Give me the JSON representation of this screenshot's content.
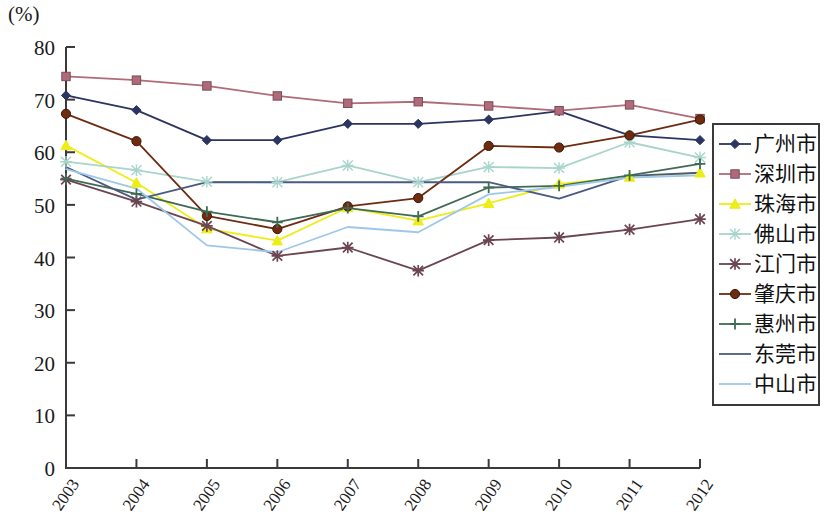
{
  "axis_unit_label": "(%)",
  "chart_data": {
    "type": "line",
    "title": "",
    "subtitle": "",
    "xlabel": "",
    "ylabel": "(%)",
    "ylim": [
      0,
      80
    ],
    "ytick_values": [
      0,
      10,
      20,
      30,
      40,
      50,
      60,
      70,
      80
    ],
    "ytick_labels": [
      "0",
      "10",
      "20",
      "30",
      "40",
      "50",
      "60",
      "70",
      "80"
    ],
    "grid": false,
    "legend_position": "right",
    "categories": [
      "2003",
      "2004",
      "2005",
      "2006",
      "2007",
      "2008",
      "2009",
      "2010",
      "2011",
      "2012"
    ],
    "x": [
      2003,
      2004,
      2005,
      2006,
      2007,
      2008,
      2009,
      2010,
      2011,
      2012
    ],
    "series": [
      {
        "name": "广州市",
        "color": "#2b3560",
        "marker": "diamond",
        "values": [
          70.8,
          68.0,
          62.3,
          62.3,
          65.4,
          65.4,
          66.2,
          67.8,
          63.2,
          62.3
        ]
      },
      {
        "name": "深圳市",
        "color": "#b06b7a",
        "marker": "square",
        "values": [
          74.4,
          73.7,
          72.6,
          70.7,
          69.3,
          69.6,
          68.8,
          67.9,
          69.0,
          66.4
        ]
      },
      {
        "name": "珠海市",
        "color": "#eded18",
        "marker": "triangle",
        "values": [
          61.3,
          54.2,
          45.5,
          43.2,
          49.5,
          47.0,
          50.3,
          54.0,
          55.3,
          56.1
        ]
      },
      {
        "name": "佛山市",
        "color": "#a8d5cb",
        "marker": "star",
        "values": [
          58.2,
          56.6,
          54.4,
          54.3,
          57.5,
          54.3,
          57.2,
          57.0,
          61.9,
          59.0
        ]
      },
      {
        "name": "江门市",
        "color": "#6b4550",
        "marker": "asterisk",
        "values": [
          54.8,
          50.6,
          46.0,
          40.3,
          41.9,
          37.5,
          43.3,
          43.8,
          45.3,
          47.3
        ]
      },
      {
        "name": "肇庆市",
        "color": "#6e2b10",
        "marker": "circle",
        "values": [
          67.3,
          62.1,
          47.9,
          45.4,
          49.7,
          51.3,
          61.2,
          60.9,
          63.2,
          66.2
        ]
      },
      {
        "name": "惠州市",
        "color": "#3f6b55",
        "marker": "plus",
        "values": [
          55.0,
          52.1,
          48.7,
          46.7,
          49.4,
          47.8,
          53.3,
          53.6,
          55.6,
          57.8
        ]
      },
      {
        "name": "东莞市",
        "color": "#4a5b82",
        "marker": "line",
        "values": [
          57.2,
          51.0,
          54.3,
          54.3,
          54.3,
          54.3,
          54.3,
          51.2,
          55.5,
          56.1
        ]
      },
      {
        "name": "中山市",
        "color": "#9fc7e8",
        "marker": "line",
        "values": [
          56.8,
          53.1,
          42.3,
          41.0,
          45.8,
          44.8,
          52.0,
          53.4,
          55.2,
          55.6
        ]
      }
    ]
  },
  "legend": {
    "items": [
      {
        "label": "广州市"
      },
      {
        "label": "深圳市"
      },
      {
        "label": "珠海市"
      },
      {
        "label": "佛山市"
      },
      {
        "label": "江门市"
      },
      {
        "label": "肇庆市"
      },
      {
        "label": "惠州市"
      },
      {
        "label": "东莞市"
      },
      {
        "label": "中山市"
      }
    ]
  }
}
